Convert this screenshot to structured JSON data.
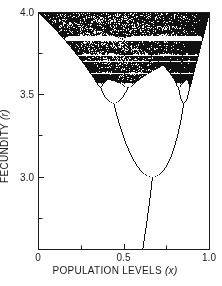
{
  "figure": {
    "background_color": "#ffffff",
    "ink_color": "#1c1c1c",
    "dot_color": "#101010"
  },
  "chart_data": {
    "type": "scatter",
    "subtype": "bifurcation-diagram",
    "title": "",
    "equation": "x[n+1] = r · x[n] · (1 − x[n])",
    "xlabel": {
      "text": "POPULATION LEVELS",
      "var": "(x)"
    },
    "ylabel": {
      "text": "FECUNDITY",
      "var": "(r)"
    },
    "x_axis": {
      "min": 0,
      "max": 1.0,
      "ticks": [
        {
          "v": 0,
          "label": "0"
        },
        {
          "v": 0.25
        },
        {
          "v": 0.5,
          "label": "0.5"
        },
        {
          "v": 0.75
        },
        {
          "v": 1.0,
          "label": "1.0"
        }
      ]
    },
    "y_axis": {
      "min": 2.56,
      "max": 4.0,
      "ticks": [
        {
          "v": 4.0,
          "label": "4.0"
        },
        {
          "v": 3.75
        },
        {
          "v": 3.5,
          "label": "3.5"
        },
        {
          "v": 3.25
        },
        {
          "v": 3.0,
          "label": "3.0"
        },
        {
          "v": 2.75
        }
      ]
    },
    "generator": {
      "transient_iterations": 3000,
      "plotted_iterations": 340,
      "initial_x": 0.31
    },
    "key_features": [
      {
        "feature": "stable-fixed-point-branch",
        "r_range": [
          2.56,
          3.0
        ],
        "description": "single curve x = 1 − 1/r rising from x ≈ 0.61 at the bottom axis to x = 0.667 at r = 3.0"
      },
      {
        "feature": "period-2-fork",
        "r": 3.0,
        "x": 0.667,
        "description": "parabola-shaped pair of branches opening upward from the fork"
      },
      {
        "feature": "period-4-branches",
        "r_range": [
          3.449,
          3.544
        ],
        "branch_centers_x": [
          0.44,
          0.85
        ]
      },
      {
        "feature": "chaos-onset",
        "r": 3.57
      },
      {
        "feature": "chaotic-region",
        "r_range": [
          3.57,
          4.0
        ],
        "description": "dense stippled band widening to span the full interval 0–1 at r = 4.0"
      },
      {
        "feature": "period-3-window",
        "r_range": [
          3.828,
          3.857
        ],
        "description": "prominent white horizontal gap across the chaotic band"
      },
      {
        "feature": "smaller-periodic-windows",
        "r_values": [
          3.74,
          3.63
        ]
      }
    ],
    "grid": false,
    "legend": null
  }
}
